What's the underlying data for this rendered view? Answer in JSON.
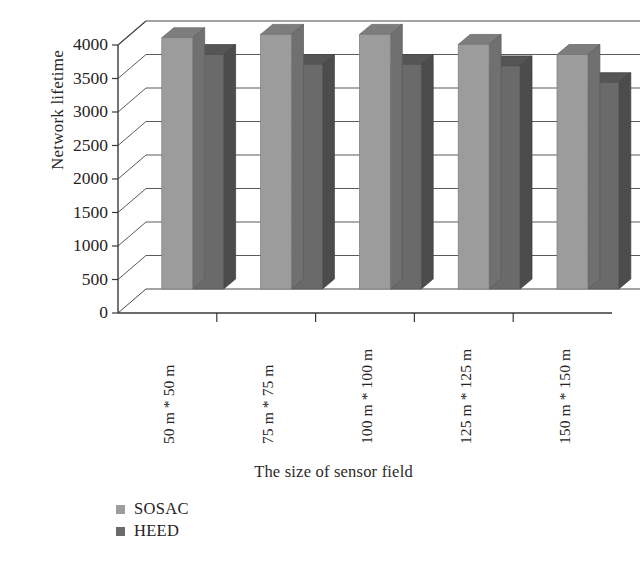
{
  "chart_data": {
    "type": "bar",
    "title": "",
    "subtitle": "",
    "xlabel": "The size of sensor field",
    "ylabel": "Network lifetime",
    "categories": [
      "50 m * 50 m",
      "75 m * 75 m",
      "100 m * 100 m",
      "125 m * 125 m",
      "150 m * 150 m"
    ],
    "series": [
      {
        "name": "SOSAC",
        "color": "#9c9c9c",
        "values": [
          3750,
          3800,
          3800,
          3650,
          3500
        ]
      },
      {
        "name": "HEED",
        "color": "#6a6a6a",
        "values": [
          3500,
          3350,
          3350,
          3330,
          3080
        ]
      }
    ],
    "ylim": [
      0,
      4000
    ],
    "yticks": [
      0,
      500,
      1000,
      1500,
      2000,
      2500,
      3000,
      3500,
      4000
    ],
    "ytick_labels": [
      "0",
      "500",
      "1000",
      "1500",
      "2000",
      "2500",
      "3000",
      "3500",
      "4000"
    ],
    "grid": true,
    "grid_axis": "y",
    "legend_position": "bottom-left",
    "style": "3d-bar",
    "xtick_rotation": -90
  },
  "legend": {
    "items": [
      {
        "label": "SOSAC",
        "color": "#9c9c9c"
      },
      {
        "label": "HEED",
        "color": "#6a6a6a"
      }
    ]
  },
  "colors": {
    "series_sosac": "#9c9c9c",
    "series_heed": "#6a6a6a",
    "axis": "#3b3836",
    "grid": "#4a4746",
    "text": "#262322",
    "background": "#ffffff"
  }
}
